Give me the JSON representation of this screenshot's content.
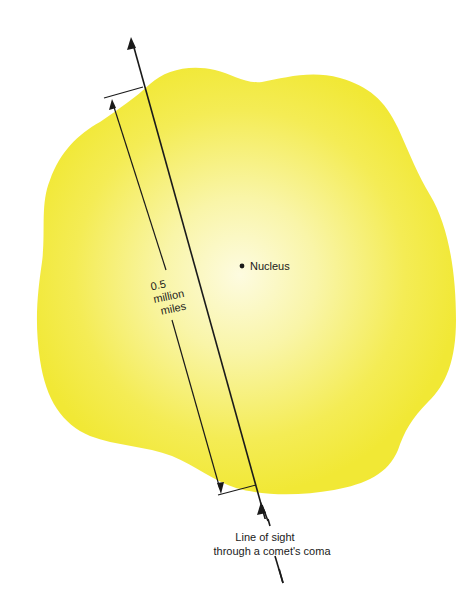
{
  "diagram": {
    "title": "Line of sight through a comet's coma",
    "colors": {
      "coma_edge": "#f2ea3c",
      "coma_center": "#fdfbe0",
      "line": "#1a1a1a",
      "background": "#ffffff"
    },
    "labels": {
      "nucleus": "Nucleus",
      "distance_line1": "0.5",
      "distance_line2": "million",
      "distance_line3": "miles",
      "sight_line1": "Line of sight",
      "sight_line2": "through a comet's coma"
    },
    "elements": [
      {
        "name": "coma",
        "shape": "irregular-blob",
        "color": "yellow"
      },
      {
        "name": "nucleus",
        "shape": "dot"
      },
      {
        "name": "line-of-sight",
        "shape": "arrow",
        "direction": "up"
      },
      {
        "name": "distance-dimension",
        "shape": "dimension-line",
        "value": "0.5 million miles"
      }
    ]
  }
}
